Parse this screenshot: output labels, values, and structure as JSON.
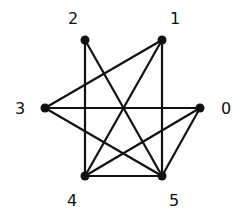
{
  "graph": {
    "nodes": [
      {
        "id": "0",
        "label": "0",
        "x": 200,
        "y": 108,
        "lx": 226,
        "ly": 114
      },
      {
        "id": "1",
        "label": "1",
        "x": 162,
        "y": 40,
        "lx": 175,
        "ly": 24
      },
      {
        "id": "2",
        "label": "2",
        "x": 85,
        "y": 40,
        "lx": 73,
        "ly": 24
      },
      {
        "id": "3",
        "label": "3",
        "x": 45,
        "y": 108,
        "lx": 20,
        "ly": 114
      },
      {
        "id": "4",
        "label": "4",
        "x": 85,
        "y": 176,
        "lx": 72,
        "ly": 206
      },
      {
        "id": "5",
        "label": "5",
        "x": 162,
        "y": 176,
        "lx": 174,
        "ly": 206
      }
    ],
    "edges": [
      [
        "2",
        "4"
      ],
      [
        "2",
        "5"
      ],
      [
        "1",
        "3"
      ],
      [
        "1",
        "4"
      ],
      [
        "1",
        "5"
      ],
      [
        "3",
        "0"
      ],
      [
        "3",
        "5"
      ],
      [
        "0",
        "4"
      ],
      [
        "0",
        "5"
      ],
      [
        "4",
        "5"
      ]
    ],
    "colors": {
      "edge": "#111111",
      "node": "#111111",
      "background": "#ffffff"
    }
  }
}
